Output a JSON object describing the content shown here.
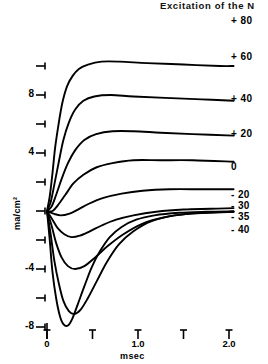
{
  "chart_data": {
    "type": "line",
    "title": "Excitation of the N",
    "xlabel": "msec",
    "ylabel": "ma/cm²",
    "xlim": [
      0,
      2.1
    ],
    "ylim": [
      -8.4,
      10.2
    ],
    "grid": false,
    "legend_position": "right-of-curve-ends",
    "xticks": [
      {
        "value": 0,
        "label": "0"
      },
      {
        "value": 0.5,
        "label": ""
      },
      {
        "value": 1.0,
        "label": "1.0"
      },
      {
        "value": 1.5,
        "label": ""
      },
      {
        "value": 2.0,
        "label": "2.0"
      }
    ],
    "yticks": [
      {
        "value": 10,
        "label": ""
      },
      {
        "value": 8,
        "label": "8"
      },
      {
        "value": 6,
        "label": ""
      },
      {
        "value": 4,
        "label": "4"
      },
      {
        "value": 2,
        "label": ""
      },
      {
        "value": 0,
        "label": ""
      },
      {
        "value": -2,
        "label": ""
      },
      {
        "value": -4,
        "label": "-4"
      },
      {
        "value": -6,
        "label": ""
      },
      {
        "value": -8,
        "label": "-8"
      }
    ],
    "series": [
      {
        "name": "+80",
        "label": "+ 80",
        "label_y": 22,
        "points": [
          [
            0.0,
            0.0
          ],
          [
            0.03,
            1.0
          ],
          [
            0.06,
            2.6
          ],
          [
            0.09,
            4.4
          ],
          [
            0.13,
            6.1
          ],
          [
            0.17,
            7.5
          ],
          [
            0.22,
            8.6
          ],
          [
            0.28,
            9.3
          ],
          [
            0.35,
            9.8
          ],
          [
            0.45,
            10.1
          ],
          [
            0.6,
            10.3
          ],
          [
            0.8,
            10.3
          ],
          [
            1.1,
            10.2
          ],
          [
            1.5,
            10.1
          ],
          [
            1.9,
            10.0
          ],
          [
            2.05,
            10.0
          ]
        ]
      },
      {
        "name": "+60",
        "label": "+ 60",
        "label_y": 58,
        "points": [
          [
            0.0,
            0.0
          ],
          [
            0.04,
            0.6
          ],
          [
            0.08,
            1.8
          ],
          [
            0.13,
            3.4
          ],
          [
            0.18,
            4.9
          ],
          [
            0.24,
            6.1
          ],
          [
            0.31,
            7.0
          ],
          [
            0.4,
            7.6
          ],
          [
            0.52,
            7.9
          ],
          [
            0.7,
            8.0
          ],
          [
            0.95,
            7.9
          ],
          [
            1.3,
            7.8
          ],
          [
            1.7,
            7.7
          ],
          [
            2.05,
            7.6
          ]
        ]
      },
      {
        "name": "+40",
        "label": "+ 40",
        "label_y": 100,
        "points": [
          [
            0.0,
            0.0
          ],
          [
            0.05,
            0.3
          ],
          [
            0.1,
            1.1
          ],
          [
            0.16,
            2.2
          ],
          [
            0.23,
            3.3
          ],
          [
            0.31,
            4.2
          ],
          [
            0.41,
            4.9
          ],
          [
            0.54,
            5.3
          ],
          [
            0.72,
            5.5
          ],
          [
            0.95,
            5.5
          ],
          [
            1.25,
            5.4
          ],
          [
            1.6,
            5.3
          ],
          [
            2.05,
            5.2
          ]
        ]
      },
      {
        "name": "+20",
        "label": "+ 20",
        "label_y": 135,
        "points": [
          [
            0.0,
            0.0
          ],
          [
            0.06,
            0.0
          ],
          [
            0.12,
            0.4
          ],
          [
            0.2,
            1.1
          ],
          [
            0.29,
            1.9
          ],
          [
            0.4,
            2.5
          ],
          [
            0.54,
            3.0
          ],
          [
            0.72,
            3.3
          ],
          [
            0.95,
            3.5
          ],
          [
            1.25,
            3.5
          ],
          [
            1.6,
            3.5
          ],
          [
            2.05,
            3.4
          ]
        ]
      },
      {
        "name": "0",
        "label": "0",
        "label_y": 168,
        "points": [
          [
            0.0,
            0.0
          ],
          [
            0.08,
            -0.2
          ],
          [
            0.15,
            -0.3
          ],
          [
            0.24,
            -0.2
          ],
          [
            0.34,
            0.1
          ],
          [
            0.46,
            0.5
          ],
          [
            0.62,
            0.9
          ],
          [
            0.82,
            1.2
          ],
          [
            1.05,
            1.4
          ],
          [
            1.35,
            1.5
          ],
          [
            1.7,
            1.5
          ],
          [
            2.05,
            1.5
          ]
        ]
      },
      {
        "name": "-20",
        "label": "- 20",
        "label_y": 196,
        "points": [
          [
            0.0,
            0.0
          ],
          [
            0.06,
            -0.6
          ],
          [
            0.12,
            -1.2
          ],
          [
            0.19,
            -1.6
          ],
          [
            0.27,
            -1.8
          ],
          [
            0.36,
            -1.7
          ],
          [
            0.47,
            -1.4
          ],
          [
            0.6,
            -1.0
          ],
          [
            0.76,
            -0.6
          ],
          [
            0.95,
            -0.3
          ],
          [
            1.2,
            -0.05
          ],
          [
            1.5,
            0.1
          ],
          [
            1.8,
            0.15
          ],
          [
            2.05,
            0.2
          ]
        ]
      },
      {
        "name": "-30",
        "label": "- 30",
        "label_y": 207,
        "points": [
          [
            0.0,
            0.0
          ],
          [
            0.05,
            -1.0
          ],
          [
            0.1,
            -2.2
          ],
          [
            0.16,
            -3.2
          ],
          [
            0.23,
            -3.8
          ],
          [
            0.31,
            -4.0
          ],
          [
            0.41,
            -3.8
          ],
          [
            0.53,
            -3.2
          ],
          [
            0.67,
            -2.4
          ],
          [
            0.84,
            -1.6
          ],
          [
            1.04,
            -0.9
          ],
          [
            1.28,
            -0.45
          ],
          [
            1.55,
            -0.2
          ],
          [
            1.85,
            -0.1
          ],
          [
            2.05,
            -0.05
          ]
        ]
      },
      {
        "name": "-35",
        "label": "- 35",
        "label_y": 218,
        "points": [
          [
            0.0,
            0.0
          ],
          [
            0.04,
            -1.6
          ],
          [
            0.08,
            -3.4
          ],
          [
            0.13,
            -5.0
          ],
          [
            0.18,
            -6.2
          ],
          [
            0.24,
            -6.9
          ],
          [
            0.3,
            -7.1
          ],
          [
            0.37,
            -6.8
          ],
          [
            0.45,
            -6.0
          ],
          [
            0.55,
            -4.8
          ],
          [
            0.66,
            -3.5
          ],
          [
            0.79,
            -2.3
          ],
          [
            0.95,
            -1.4
          ],
          [
            1.15,
            -0.7
          ],
          [
            1.4,
            -0.3
          ],
          [
            1.7,
            -0.12
          ],
          [
            2.05,
            -0.05
          ]
        ]
      },
      {
        "name": "-40",
        "label": "- 40",
        "label_y": 231,
        "points": [
          [
            0.0,
            0.0
          ],
          [
            0.03,
            -2.0
          ],
          [
            0.06,
            -4.2
          ],
          [
            0.1,
            -6.0
          ],
          [
            0.14,
            -7.2
          ],
          [
            0.18,
            -7.8
          ],
          [
            0.23,
            -7.9
          ],
          [
            0.28,
            -7.4
          ],
          [
            0.34,
            -6.4
          ],
          [
            0.41,
            -5.2
          ],
          [
            0.49,
            -3.9
          ],
          [
            0.58,
            -2.8
          ],
          [
            0.69,
            -1.8
          ],
          [
            0.82,
            -1.1
          ],
          [
            0.98,
            -0.6
          ],
          [
            1.18,
            -0.3
          ],
          [
            1.45,
            -0.12
          ],
          [
            1.75,
            -0.05
          ],
          [
            2.05,
            -0.02
          ]
        ]
      }
    ]
  }
}
